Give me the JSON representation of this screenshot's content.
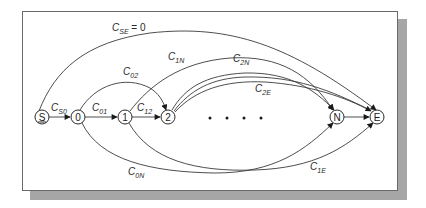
{
  "diagram": {
    "type": "directed-graph",
    "nodes": [
      {
        "id": "S",
        "label": "S",
        "underlined": true
      },
      {
        "id": "0",
        "label": "0"
      },
      {
        "id": "1",
        "label": "1"
      },
      {
        "id": "2",
        "label": "2"
      },
      {
        "id": "N",
        "label": "N"
      },
      {
        "id": "E",
        "label": "E"
      }
    ],
    "ellipsis": "• • • •",
    "edges": [
      {
        "from": "S",
        "to": "0",
        "label": "C",
        "sub": "S0"
      },
      {
        "from": "0",
        "to": "1",
        "label": "C",
        "sub": "01"
      },
      {
        "from": "1",
        "to": "2",
        "label": "C",
        "sub": "12"
      },
      {
        "from": "0",
        "to": "2",
        "label": "C",
        "sub": "02"
      },
      {
        "from": "S",
        "to": "E",
        "label": "C",
        "sub": "SE",
        "suffix": " = 0"
      },
      {
        "from": "1",
        "to": "N",
        "label": "C",
        "sub": "1N"
      },
      {
        "from": "2",
        "to": "N",
        "label": "C",
        "sub": "2N"
      },
      {
        "from": "2",
        "to": "E",
        "label": "C",
        "sub": "2E"
      },
      {
        "from": "0",
        "to": "N",
        "label": "C",
        "sub": "0N"
      },
      {
        "from": "1",
        "to": "E",
        "label": "C",
        "sub": "1E"
      },
      {
        "from": "N",
        "to": "E",
        "label": ""
      }
    ]
  }
}
